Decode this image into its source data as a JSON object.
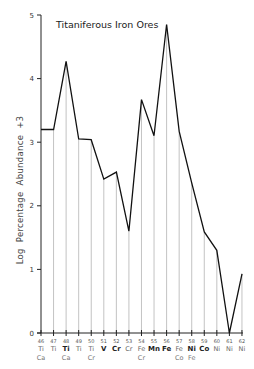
{
  "chart_data": {
    "type": "line",
    "title": "Titaniferous Iron Ores",
    "xlabel": "",
    "ylabel": "Log  Percentage  Abundance  +3",
    "ylim": [
      0,
      5
    ],
    "yticks": [
      0,
      1,
      2,
      3,
      4,
      5
    ],
    "grid": false,
    "legend": null,
    "drop_lines": true,
    "x": [
      46,
      47,
      48,
      49,
      50,
      51,
      52,
      53,
      54,
      55,
      56,
      57,
      58,
      59,
      60,
      61,
      62
    ],
    "categories": [
      {
        "mass": "46",
        "element": "Ti",
        "bold": false,
        "sub": "Ca"
      },
      {
        "mass": "47",
        "element": "Ti",
        "bold": false,
        "sub": ""
      },
      {
        "mass": "48",
        "element": "Ti",
        "bold": true,
        "sub": "Ca"
      },
      {
        "mass": "49",
        "element": "Ti",
        "bold": false,
        "sub": ""
      },
      {
        "mass": "50",
        "element": "Ti",
        "bold": false,
        "sub": "Cr"
      },
      {
        "mass": "51",
        "element": "V",
        "bold": true,
        "sub": ""
      },
      {
        "mass": "52",
        "element": "Cr",
        "bold": true,
        "sub": ""
      },
      {
        "mass": "53",
        "element": "Cr",
        "bold": false,
        "sub": ""
      },
      {
        "mass": "54",
        "element": "Fe",
        "bold": false,
        "sub": "Cr"
      },
      {
        "mass": "55",
        "element": "Mn",
        "bold": true,
        "sub": ""
      },
      {
        "mass": "56",
        "element": "Fe",
        "bold": true,
        "sub": ""
      },
      {
        "mass": "57",
        "element": "Fe",
        "bold": false,
        "sub": "Co"
      },
      {
        "mass": "58",
        "element": "Ni",
        "bold": true,
        "sub": "Fe"
      },
      {
        "mass": "59",
        "element": "Co",
        "bold": true,
        "sub": ""
      },
      {
        "mass": "60",
        "element": "Ni",
        "bold": false,
        "sub": ""
      },
      {
        "mass": "61",
        "element": "Ni",
        "bold": false,
        "sub": ""
      },
      {
        "mass": "62",
        "element": "Ni",
        "bold": false,
        "sub": ""
      }
    ],
    "series": [
      {
        "name": "Titaniferous Iron Ores",
        "values": [
          3.2,
          3.2,
          4.27,
          3.05,
          3.04,
          2.42,
          2.53,
          1.6,
          3.67,
          3.1,
          4.85,
          3.17,
          2.36,
          1.59,
          1.3,
          0.0,
          0.93
        ]
      }
    ]
  }
}
